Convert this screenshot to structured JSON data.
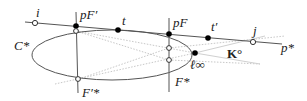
{
  "diagram": {
    "labels": {
      "i": "i",
      "pFprime": "pF′",
      "t": "t",
      "pF": "pF",
      "tprime": "t′",
      "j": "j",
      "pstar": "p*",
      "Cstar": "C*",
      "Fprimestar": "F′*",
      "Fstar": "F*",
      "linf": "ℓ∞",
      "Kcirc": "K°"
    },
    "colors": {
      "line": "#555555",
      "faint": "#c8c8c8",
      "point_filled": "#000000",
      "point_open": "#ffffff"
    }
  }
}
